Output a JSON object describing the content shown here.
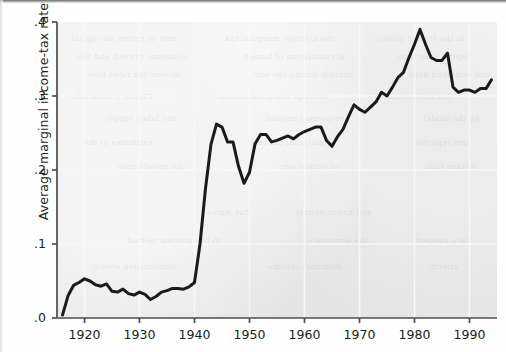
{
  "figure": {
    "background_color": "#fefefe",
    "panel_color": "#e9e9e9",
    "line_color": "#1a1a1a",
    "axis_color": "#4d4d4d",
    "gridline_color": "#f7f7f7"
  },
  "axis": {
    "ylabel": "Average marginal income-tax rate",
    "xlabel": "",
    "yticks": [
      ".0",
      ".1",
      ".2",
      ".3",
      ".4"
    ],
    "xticks": [
      "1920",
      "1930",
      "1940",
      "1950",
      "1960",
      "1970",
      "1980",
      "1990"
    ]
  },
  "bleed_text": [
    {
      "text": "rate of return on capital",
      "x": 14,
      "y": 12
    },
    {
      "text": "the average marginal tax",
      "x": 168,
      "y": 12
    },
    {
      "text": "in the United States",
      "x": 320,
      "y": 12
    },
    {
      "text": "economic growth and the",
      "x": 20,
      "y": 30
    },
    {
      "text": "accumulation of human",
      "x": 186,
      "y": 30
    },
    {
      "text": "capital over time",
      "x": 340,
      "y": 30
    },
    {
      "text": "income-tax rates rose",
      "x": 30,
      "y": 48
    },
    {
      "text": "sharply during the war",
      "x": 196,
      "y": 48
    },
    {
      "text": "and remained high",
      "x": 352,
      "y": 48
    },
    {
      "text": "Figure 3 shows the",
      "x": 12,
      "y": 70
    },
    {
      "text": "average marginal income",
      "x": 160,
      "y": 70
    },
    {
      "text": "tax rate series",
      "x": 330,
      "y": 70
    },
    {
      "text": "the labor supply",
      "x": 48,
      "y": 92
    },
    {
      "text": "responses implied",
      "x": 208,
      "y": 92
    },
    {
      "text": "by the model",
      "x": 366,
      "y": 92
    },
    {
      "text": "estimates of the",
      "x": 26,
      "y": 116
    },
    {
      "text": "marginal tax rate",
      "x": 192,
      "y": 116
    },
    {
      "text": "are reported",
      "x": 356,
      "y": 116
    },
    {
      "text": "the growth rate",
      "x": 60,
      "y": 140
    },
    {
      "text": "of output per",
      "x": 224,
      "y": 140
    },
    {
      "text": "worker falls",
      "x": 368,
      "y": 140
    },
    {
      "text": "Tax Rates",
      "x": 150,
      "y": 186
    },
    {
      "text": "and Labor Supply",
      "x": 238,
      "y": 186
    },
    {
      "text": "in the postwar period",
      "x": 70,
      "y": 214
    },
    {
      "text": "the aggregate",
      "x": 250,
      "y": 214
    },
    {
      "text": "data suggest",
      "x": 358,
      "y": 214
    },
    {
      "text": "substitution effects",
      "x": 34,
      "y": 240
    },
    {
      "text": "dominate income",
      "x": 210,
      "y": 240
    },
    {
      "text": "effects",
      "x": 372,
      "y": 240
    }
  ],
  "chart_data": {
    "type": "line",
    "title": "",
    "xlabel": "",
    "ylabel": "Average marginal income-tax rate",
    "xlim": [
      1915,
      1995
    ],
    "ylim": [
      0.0,
      0.4
    ],
    "grid": true,
    "legend": "none",
    "series": [
      {
        "name": "Average marginal income-tax rate",
        "color": "#1a1a1a",
        "x": [
          1916,
          1917,
          1918,
          1919,
          1920,
          1921,
          1922,
          1923,
          1924,
          1925,
          1926,
          1927,
          1928,
          1929,
          1930,
          1931,
          1932,
          1933,
          1934,
          1935,
          1936,
          1937,
          1938,
          1939,
          1940,
          1941,
          1942,
          1943,
          1944,
          1945,
          1946,
          1947,
          1948,
          1949,
          1950,
          1951,
          1952,
          1953,
          1954,
          1955,
          1956,
          1957,
          1958,
          1959,
          1960,
          1961,
          1962,
          1963,
          1964,
          1965,
          1966,
          1967,
          1968,
          1969,
          1970,
          1971,
          1972,
          1973,
          1974,
          1975,
          1976,
          1977,
          1978,
          1979,
          1980,
          1981,
          1982,
          1983,
          1984,
          1985,
          1986,
          1987,
          1988,
          1989,
          1990,
          1991,
          1992,
          1993,
          1994
        ],
        "y": [
          0.004,
          0.03,
          0.044,
          0.048,
          0.053,
          0.05,
          0.045,
          0.043,
          0.046,
          0.036,
          0.035,
          0.039,
          0.033,
          0.031,
          0.035,
          0.032,
          0.025,
          0.029,
          0.035,
          0.037,
          0.04,
          0.04,
          0.039,
          0.042,
          0.048,
          0.1,
          0.175,
          0.235,
          0.262,
          0.258,
          0.238,
          0.238,
          0.205,
          0.182,
          0.197,
          0.235,
          0.248,
          0.248,
          0.238,
          0.24,
          0.243,
          0.246,
          0.242,
          0.248,
          0.252,
          0.255,
          0.258,
          0.258,
          0.24,
          0.232,
          0.245,
          0.255,
          0.272,
          0.288,
          0.282,
          0.278,
          0.285,
          0.292,
          0.305,
          0.3,
          0.312,
          0.325,
          0.332,
          0.352,
          0.37,
          0.39,
          0.37,
          0.352,
          0.348,
          0.348,
          0.358,
          0.312,
          0.305,
          0.308,
          0.308,
          0.305,
          0.31,
          0.31,
          0.322
        ]
      }
    ]
  }
}
